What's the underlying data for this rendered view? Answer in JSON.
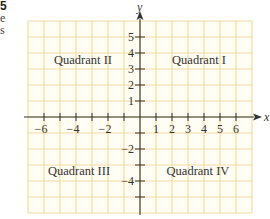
{
  "edge_fragments": [
    "5",
    "e",
    "s"
  ],
  "axes": {
    "x_label": "x",
    "y_label": "y",
    "x_ticks": [
      {
        "value": -6,
        "label": "−6"
      },
      {
        "value": -4,
        "label": "−4"
      },
      {
        "value": -2,
        "label": "−2"
      },
      {
        "value": 1,
        "label": "1"
      },
      {
        "value": 2,
        "label": "2"
      },
      {
        "value": 3,
        "label": "3"
      },
      {
        "value": 4,
        "label": "4"
      },
      {
        "value": 5,
        "label": "5"
      },
      {
        "value": 6,
        "label": "6"
      }
    ],
    "y_ticks": [
      {
        "value": 5,
        "label": "5"
      },
      {
        "value": 4,
        "label": "4"
      },
      {
        "value": 3,
        "label": "3"
      },
      {
        "value": 2,
        "label": "2"
      },
      {
        "value": 1,
        "label": "1"
      },
      {
        "value": -2,
        "label": "−2"
      },
      {
        "value": -4,
        "label": "−4"
      }
    ],
    "x_range": [
      -7,
      7
    ],
    "y_range": [
      -6,
      6
    ]
  },
  "quadrants": {
    "q1": "Quadrant I",
    "q2": "Quadrant II",
    "q3": "Quadrant III",
    "q4": "Quadrant IV"
  },
  "colors": {
    "grid": "#f3dca0",
    "grid_bg": "#fffdf4",
    "axis": "#333333",
    "text": "#333333"
  }
}
